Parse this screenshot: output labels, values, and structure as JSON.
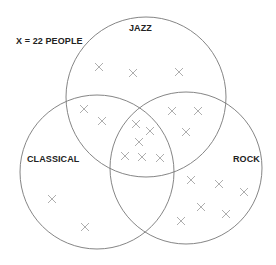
{
  "legend": {
    "text": "X = 22 PEOPLE"
  },
  "sets": [
    {
      "name": "JAZZ",
      "cx": 146,
      "cy": 97,
      "r": 80
    },
    {
      "name": "CLASSICAL",
      "cx": 97,
      "cy": 172,
      "r": 77
    },
    {
      "name": "ROCK",
      "cx": 186,
      "cy": 168,
      "r": 76
    }
  ],
  "chart_data": {
    "type": "venn",
    "unit": "X = 22 people",
    "sets": [
      "JAZZ",
      "CLASSICAL",
      "ROCK"
    ],
    "regions": [
      {
        "sets": [
          "JAZZ"
        ],
        "marks": 3,
        "people": 66
      },
      {
        "sets": [
          "CLASSICAL"
        ],
        "marks": 2,
        "people": 44
      },
      {
        "sets": [
          "ROCK"
        ],
        "marks": 6,
        "people": 132
      },
      {
        "sets": [
          "JAZZ",
          "CLASSICAL"
        ],
        "marks": 2,
        "people": 44
      },
      {
        "sets": [
          "JAZZ",
          "ROCK"
        ],
        "marks": 3,
        "people": 66
      },
      {
        "sets": [
          "CLASSICAL",
          "ROCK"
        ],
        "marks": 0,
        "people": 0
      },
      {
        "sets": [
          "JAZZ",
          "CLASSICAL",
          "ROCK"
        ],
        "marks": 6,
        "people": 132
      }
    ]
  },
  "marks": [
    [
      99,
      67
    ],
    [
      133,
      73
    ],
    [
      179,
      72
    ],
    [
      84,
      109
    ],
    [
      102,
      121
    ],
    [
      172,
      111
    ],
    [
      198,
      111
    ],
    [
      186,
      132
    ],
    [
      136,
      124
    ],
    [
      150,
      131
    ],
    [
      139,
      142
    ],
    [
      125,
      156
    ],
    [
      142,
      157
    ],
    [
      160,
      158
    ],
    [
      52,
      199
    ],
    [
      85,
      227
    ],
    [
      191,
      180
    ],
    [
      219,
      184
    ],
    [
      244,
      192
    ],
    [
      201,
      207
    ],
    [
      226,
      214
    ],
    [
      181,
      221
    ]
  ]
}
